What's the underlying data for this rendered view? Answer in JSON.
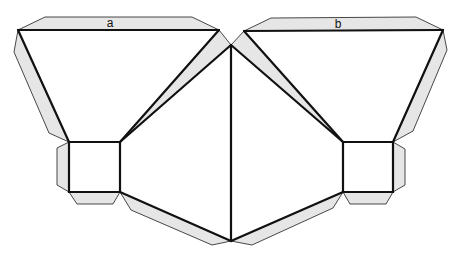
{
  "diagram": {
    "type": "paper net (foldable template)",
    "labels": {
      "left_face": "a",
      "right_face": "b"
    },
    "colors": {
      "tab_fill": "#e6e6e6",
      "tab_stroke": "#333333",
      "edge": "#111111",
      "background": "#ffffff"
    },
    "parts": {
      "faces": [
        "left-top-triangle (a)",
        "left-square",
        "left-middle-triangle",
        "center-left-triangle",
        "center-right-triangle",
        "right-middle-triangle",
        "right-square",
        "right-top-triangle (b)"
      ],
      "tabs": [
        "tab-a-top",
        "tab-left-side",
        "tab-left-square-side",
        "tab-left-square-bottom",
        "tab-left-bottom-long",
        "tab-center-left",
        "tab-b-top",
        "tab-right-side",
        "tab-right-square-side",
        "tab-right-square-bottom",
        "tab-right-bottom-long",
        "tab-center-right"
      ]
    }
  }
}
